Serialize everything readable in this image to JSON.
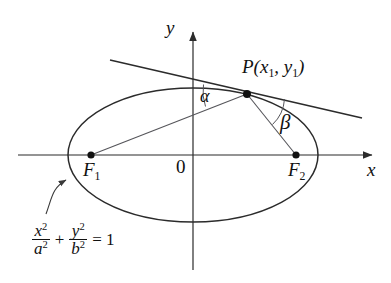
{
  "figure": {
    "kind": "geometry-diagram",
    "background_color": "#ffffff",
    "stroke_color": "#2b2b2b",
    "axes": {
      "x_label": "x",
      "y_label": "y",
      "origin_label": "0",
      "x_axis": {
        "x1": 18,
        "y1": 155,
        "x2": 372,
        "y2": 155
      },
      "y_axis": {
        "x1": 193,
        "y1": 270,
        "x2": 193,
        "y2": 32
      }
    },
    "ellipse": {
      "cx": 193,
      "cy": 155,
      "rx": 125,
      "ry": 67
    },
    "points": [
      {
        "name": "F1",
        "label": "F",
        "sub": "1",
        "x": 91,
        "y": 155,
        "label_x": 83,
        "label_y": 160
      },
      {
        "name": "F2",
        "label": "F",
        "sub": "2",
        "x": 296,
        "y": 155,
        "label_x": 288,
        "label_y": 160
      },
      {
        "name": "P",
        "label": "P(x",
        "sub1": "1",
        "mid": ", y",
        "sub2": "1",
        "close": ")",
        "x": 247,
        "y": 94,
        "label_x": 242,
        "label_y": 57
      }
    ],
    "labels": {
      "p_point": "P(x₁, y₁)",
      "p_head": "P(",
      "p_x": "x",
      "p_x_sub": "1",
      "p_sep": ", ",
      "p_y": "y",
      "p_y_sub": "1",
      "p_tail": ")",
      "f_letter": "F",
      "f1_sub": "1",
      "f2_sub": "2",
      "alpha": "α",
      "beta": "β",
      "origin": "0",
      "x_axis": "x",
      "y_axis": "y"
    },
    "segments": [
      {
        "name": "focal-radius-PF1",
        "x1": 247,
        "y1": 94,
        "x2": 91,
        "y2": 155
      },
      {
        "name": "focal-radius-PF2",
        "x1": 247,
        "y1": 94,
        "x2": 296,
        "y2": 155
      },
      {
        "name": "tangent-line",
        "x1": 110,
        "y1": 60,
        "x2": 362,
        "y2": 118
      }
    ],
    "angle_arcs": [
      {
        "name": "alpha-arc",
        "vertex": "P",
        "between": [
          "tangent-left",
          "PF1"
        ],
        "label": "α"
      },
      {
        "name": "beta-arc",
        "vertex": "P",
        "between": [
          "PF2",
          "tangent-right"
        ],
        "label": "β"
      }
    ],
    "callout": {
      "name": "equation-pointer",
      "from_x": 46,
      "from_y": 214,
      "to_x": 68,
      "to_y": 178
    },
    "equation": {
      "term1_num": "x",
      "term1_num_sup": "2",
      "term1_den": "a",
      "term1_den_sup": "2",
      "plus": "+",
      "term2_num": "y",
      "term2_num_sup": "2",
      "term2_den": "b",
      "term2_den_sup": "2",
      "equals": "= 1",
      "plain": "x²/a² + y²/b² = 1"
    }
  }
}
